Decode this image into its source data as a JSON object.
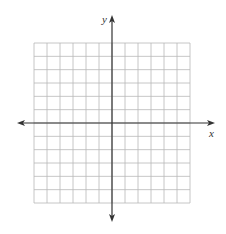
{
  "graph": {
    "type": "coordinate-plane",
    "x_label": "x",
    "y_label": "y",
    "grid": {
      "columns": 12,
      "rows": 12,
      "left": 34,
      "top": 43,
      "width": 156,
      "height": 160
    },
    "origin": {
      "x": 112,
      "y": 123
    },
    "x_axis": {
      "y": 123,
      "left_tip": 17,
      "right_tip": 215
    },
    "y_axis": {
      "x": 112,
      "top_tip": 15,
      "bottom_tip": 222
    },
    "colors": {
      "grid_line": "#b8b8b8",
      "axis_line": "#333333",
      "label": "#333333",
      "background": "#ffffff"
    }
  }
}
